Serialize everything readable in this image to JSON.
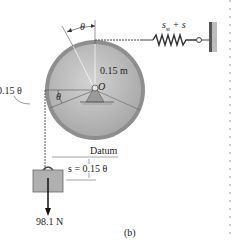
{
  "figure": {
    "caption": "(b)",
    "labels": {
      "theta_top": "θ",
      "spring_label": "s_st + s",
      "spring_label_main": "s",
      "spring_label_sub": "st",
      "spring_label_rest": " + s",
      "radius": "0.15 m",
      "pivot": "O",
      "arc_left": "0.15 θ",
      "theta_inner": "θ",
      "datum": "Datum",
      "displacement": "s = 0.15 θ",
      "weight": "98.1 N"
    },
    "colors": {
      "disk_fill": "#b9b9b9",
      "disk_rim": "#8e8e8e",
      "block_fill": "#b0b0b0",
      "line": "#333333",
      "wall": "#7a7a7a"
    }
  }
}
